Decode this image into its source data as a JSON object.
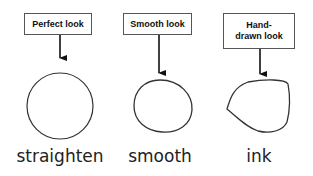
{
  "panels": [
    {
      "box_label": "Perfect look",
      "mode_label": "straighten"
    },
    {
      "box_label": "Smooth look",
      "mode_label": "smooth"
    },
    {
      "box_label": "Hand-drawn look",
      "mode_label": "ink"
    }
  ],
  "colors": {
    "stroke": "#222222",
    "box_border": "#555555"
  }
}
